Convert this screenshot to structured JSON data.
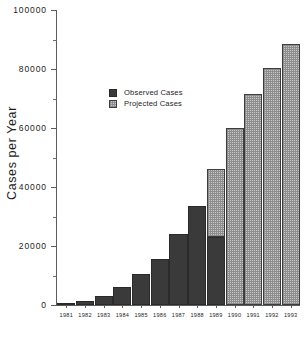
{
  "chart_data": {
    "type": "bar",
    "title": "",
    "subtitle": "",
    "xlabel": "",
    "ylabel": "Cases per Year",
    "ylim": [
      0,
      100000
    ],
    "xlim_categories": [
      "1981",
      "1982",
      "1983",
      "1984",
      "1985",
      "1986",
      "1987",
      "1988",
      "1989",
      "1990",
      "1991",
      "1992",
      "1993"
    ],
    "categories": [
      "1981",
      "1982",
      "1983",
      "1984",
      "1985",
      "1986",
      "1987",
      "1988",
      "1989",
      "1990",
      "1991",
      "1992",
      "1993"
    ],
    "y_tick_labels": [
      "0",
      "20000",
      "40000",
      "60000",
      "80000",
      "100000"
    ],
    "y_tick_values": [
      0,
      20000,
      40000,
      60000,
      80000,
      100000
    ],
    "y_minor_tick_values": [
      10000,
      30000,
      50000,
      70000,
      90000
    ],
    "grid": false,
    "stacked": true,
    "legend_position": "inside-upper-left",
    "series": [
      {
        "name": "Observed Cases",
        "color": "#3a3a3a",
        "pattern": "solid",
        "values": [
          500,
          1500,
          3000,
          6000,
          10500,
          15500,
          24000,
          33500,
          23000,
          0,
          0,
          0,
          0
        ]
      },
      {
        "name": "Projected Cases",
        "color": "#c9c9c9",
        "pattern": "checker-hatch",
        "values": [
          0,
          0,
          0,
          0,
          0,
          0,
          0,
          0,
          23000,
          60000,
          71500,
          80500,
          88500
        ]
      }
    ],
    "totals": [
      500,
      1500,
      3000,
      6000,
      10500,
      15500,
      24000,
      33500,
      46000,
      60000,
      71500,
      80500,
      88500
    ]
  },
  "legend": {
    "entries": [
      {
        "label": "Observed Cases",
        "swatch": "observed"
      },
      {
        "label": "Projected Cases",
        "swatch": "projected"
      }
    ]
  },
  "axes": {
    "y_title": "Cases per Year"
  }
}
